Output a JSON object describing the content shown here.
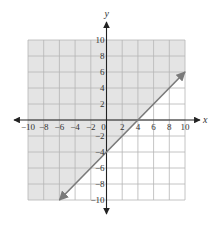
{
  "chart_data": {
    "type": "line",
    "title": "",
    "xlabel": "x",
    "ylabel": "y",
    "xlim": [
      -10,
      10
    ],
    "ylim": [
      -10,
      10
    ],
    "grid": true,
    "x_ticks": [
      -10,
      -8,
      -6,
      -4,
      -2,
      0,
      2,
      4,
      6,
      8,
      10
    ],
    "y_ticks": [
      10,
      8,
      6,
      4,
      2,
      -2,
      -4,
      -6,
      -8,
      -10
    ],
    "x_tick_labels": [
      "−10",
      "−8",
      "−6",
      "−4",
      "−2",
      "0",
      "2",
      "4",
      "6",
      "8",
      "10"
    ],
    "y_tick_labels": [
      "10",
      "8",
      "6",
      "4",
      "2",
      "−2",
      "−4",
      "−6",
      "−8",
      "−10"
    ],
    "series": [
      {
        "name": "boundary line y = x − 4",
        "style": "solid",
        "arrows": "both",
        "points": [
          [
            -6,
            -10
          ],
          [
            10,
            6
          ]
        ]
      }
    ],
    "shaded_region": "above line (y ≥ x − 4)",
    "inequality": "y ≥ x − 4"
  },
  "colors": {
    "shade": "#e4e4e4",
    "grid": "#b5b5b5",
    "axis": "#222222",
    "line": "#7a7a7a"
  }
}
